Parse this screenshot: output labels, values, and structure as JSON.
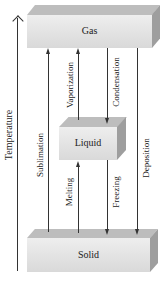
{
  "axis": {
    "label": "Temperature"
  },
  "states": {
    "gas": {
      "label": "Gas"
    },
    "liquid": {
      "label": "Liquid"
    },
    "solid": {
      "label": "Solid"
    }
  },
  "transitions": {
    "sublimation": {
      "label": "Sublimation",
      "from": "Solid",
      "to": "Gas",
      "direction": "up"
    },
    "vaporization": {
      "label": "Vaporization",
      "from": "Liquid",
      "to": "Gas",
      "direction": "up"
    },
    "condensation": {
      "label": "Condensation",
      "from": "Gas",
      "to": "Liquid",
      "direction": "down"
    },
    "deposition": {
      "label": "Deposition",
      "from": "Gas",
      "to": "Solid",
      "direction": "down"
    },
    "melting": {
      "label": "Melting",
      "from": "Solid",
      "to": "Liquid",
      "direction": "up"
    },
    "freezing": {
      "label": "Freezing",
      "from": "Liquid",
      "to": "Solid",
      "direction": "down"
    }
  },
  "colors": {
    "box_front": "#e6e6e6",
    "box_top": "#bdbdbd",
    "box_side": "#9e9e9e",
    "arrow": "#333333"
  }
}
